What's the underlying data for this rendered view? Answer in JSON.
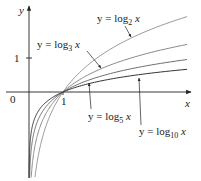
{
  "chart_data": {
    "type": "line",
    "title": "",
    "xlabel": "x",
    "ylabel": "y",
    "x_tick_labels": [
      "0",
      "1"
    ],
    "y_tick_labels": [
      "1"
    ],
    "xlim": [
      0,
      4.7
    ],
    "ylim": [
      -2.5,
      2.6
    ],
    "grid": false,
    "legend": "none (curves labeled directly with leader arrows)",
    "series": [
      {
        "name": "y = log2 x",
        "base": 2,
        "color": "#9a9a9a",
        "label_main": "y = log",
        "label_sub": "2",
        "label_var": "x",
        "points": [
          [
            0.25,
            -2.0
          ],
          [
            0.5,
            -1.0
          ],
          [
            1,
            0
          ],
          [
            2,
            1.0
          ],
          [
            4,
            2.0
          ],
          [
            4.65,
            2.22
          ]
        ]
      },
      {
        "name": "y = log3 x",
        "base": 3,
        "color": "#8a8a8a",
        "label_main": "y = log",
        "label_sub": "3",
        "label_var": "x",
        "points": [
          [
            0.25,
            -1.26
          ],
          [
            0.5,
            -0.63
          ],
          [
            1,
            0
          ],
          [
            2,
            0.63
          ],
          [
            3,
            1.0
          ],
          [
            4.65,
            1.4
          ]
        ]
      },
      {
        "name": "y = log5 x",
        "base": 5,
        "color": "#6e6e6e",
        "label_main": "y = log",
        "label_sub": "5",
        "label_var": "x",
        "points": [
          [
            0.25,
            -0.86
          ],
          [
            0.5,
            -0.43
          ],
          [
            1,
            0
          ],
          [
            2,
            0.43
          ],
          [
            4,
            0.86
          ],
          [
            4.65,
            0.955
          ]
        ]
      },
      {
        "name": "y = log10 x",
        "base": 10,
        "color": "#333333",
        "label_main": "y = log",
        "label_sub": "10",
        "label_var": "x",
        "points": [
          [
            0.25,
            -0.6
          ],
          [
            0.5,
            -0.3
          ],
          [
            1,
            0
          ],
          [
            2,
            0.3
          ],
          [
            4,
            0.6
          ],
          [
            4.65,
            0.667
          ]
        ]
      }
    ],
    "annotations": [
      "All curves pass through (1, 0)"
    ]
  },
  "axes": {
    "x_label": "x",
    "y_label": "y",
    "origin_label": "0",
    "x_tick_one": "1",
    "y_tick_one": "1"
  }
}
